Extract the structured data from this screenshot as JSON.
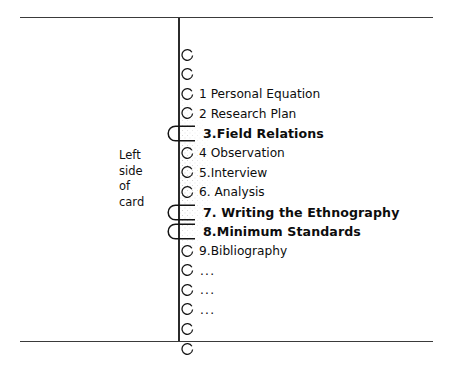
{
  "figure": {
    "caption_lines": [
      "Left",
      "side",
      "of",
      "card"
    ],
    "frame_color": "#3a3a3a",
    "spine_color": "#2b2b2b",
    "stipple_color": "#555555",
    "text_color": "#0d0d0d"
  },
  "list": {
    "rows": [
      {
        "marker": "circle",
        "label": "",
        "bold": false
      },
      {
        "marker": "circle",
        "label": "",
        "bold": false
      },
      {
        "marker": "circle",
        "label": "1 Personal Equation",
        "bold": false
      },
      {
        "marker": "circle",
        "label": "2 Research Plan",
        "bold": false
      },
      {
        "marker": "tab",
        "label": "3.Field Relations",
        "bold": true
      },
      {
        "marker": "circle",
        "label": "4 Observation",
        "bold": false
      },
      {
        "marker": "circle",
        "label": "5.Interview",
        "bold": false
      },
      {
        "marker": "circle",
        "label": "6. Analysis",
        "bold": false
      },
      {
        "marker": "tab",
        "label": "7. Writing the Ethnography",
        "bold": true
      },
      {
        "marker": "tab",
        "label": "8.Minimum Standards",
        "bold": true
      },
      {
        "marker": "circle",
        "label": "9.Bibliography",
        "bold": false
      },
      {
        "marker": "circle",
        "label": "...",
        "bold": false
      },
      {
        "marker": "circle",
        "label": "...",
        "bold": false
      },
      {
        "marker": "circle",
        "label": "...",
        "bold": false
      },
      {
        "marker": "circle",
        "label": "",
        "bold": false
      },
      {
        "marker": "circle",
        "label": "",
        "bold": false
      }
    ]
  }
}
